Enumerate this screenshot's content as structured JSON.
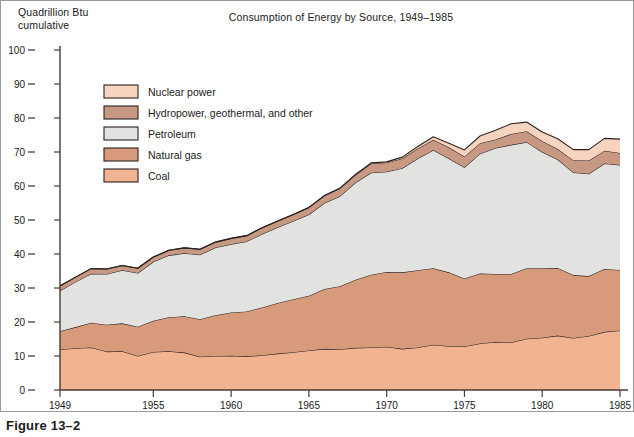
{
  "figure": {
    "caption": "Figure 13–2",
    "axis_unit_label": "Quadrillion Btu\ncumulative"
  },
  "chart_data": {
    "type": "area",
    "stacked": true,
    "title": "Consumption of Energy by Source, 1949–1985",
    "xlabel": "",
    "ylabel": "Quadrillion Btu cumulative",
    "ylim": [
      0,
      100
    ],
    "xlim": [
      1949,
      1985
    ],
    "grid": false,
    "legend_position": "upper-left-inside",
    "y_ticks": [
      0,
      10,
      20,
      30,
      40,
      50,
      60,
      70,
      80,
      90,
      100
    ],
    "x_ticks": [
      1949,
      1955,
      1960,
      1965,
      1970,
      1975,
      1980,
      1985
    ],
    "x": [
      1949,
      1950,
      1951,
      1952,
      1953,
      1954,
      1955,
      1956,
      1957,
      1958,
      1959,
      1960,
      1961,
      1962,
      1963,
      1964,
      1965,
      1966,
      1967,
      1968,
      1969,
      1970,
      1971,
      1972,
      1973,
      1974,
      1975,
      1976,
      1977,
      1978,
      1979,
      1980,
      1981,
      1982,
      1983,
      1984,
      1985
    ],
    "series": [
      {
        "name": "Coal",
        "color": "#f2b393",
        "values": [
          11.9,
          12.3,
          12.5,
          11.3,
          11.4,
          10.0,
          11.2,
          11.4,
          11.0,
          9.8,
          10.0,
          10.1,
          9.9,
          10.2,
          10.7,
          11.1,
          11.6,
          12.1,
          12.0,
          12.4,
          12.5,
          12.7,
          12.1,
          12.5,
          13.3,
          12.9,
          12.8,
          13.7,
          14.1,
          14.0,
          15.1,
          15.4,
          16.0,
          15.3,
          15.9,
          17.1,
          17.5
        ]
      },
      {
        "name": "Natural gas",
        "color": "#d79b7b",
        "values": [
          5.4,
          6.2,
          7.3,
          7.9,
          8.2,
          8.6,
          9.2,
          10.0,
          10.7,
          11.0,
          12.0,
          12.7,
          13.2,
          14.1,
          14.9,
          15.6,
          16.1,
          17.6,
          18.5,
          20.0,
          21.4,
          22.0,
          22.5,
          22.7,
          22.5,
          21.7,
          20.0,
          20.6,
          20.0,
          20.1,
          20.7,
          20.4,
          19.9,
          18.5,
          17.6,
          18.5,
          17.8
        ]
      },
      {
        "name": "Petroleum",
        "color": "#e2e3e1",
        "values": [
          11.9,
          13.3,
          14.4,
          14.9,
          15.6,
          15.8,
          17.3,
          18.2,
          18.5,
          19.0,
          19.9,
          20.1,
          20.6,
          21.6,
          22.3,
          23.0,
          23.9,
          25.3,
          26.5,
          28.6,
          30.0,
          29.5,
          30.6,
          32.9,
          34.8,
          33.5,
          32.7,
          35.2,
          37.1,
          38.0,
          37.1,
          34.2,
          31.9,
          30.2,
          30.1,
          31.0,
          30.9
        ]
      },
      {
        "name": "Hydropower, geothermal, and other",
        "color": "#c79982",
        "values": [
          1.4,
          1.4,
          1.5,
          1.5,
          1.4,
          1.4,
          1.4,
          1.5,
          1.6,
          1.6,
          1.6,
          1.7,
          1.7,
          1.8,
          1.8,
          1.9,
          2.1,
          2.1,
          2.3,
          2.3,
          2.7,
          2.7,
          2.9,
          2.9,
          3.0,
          3.3,
          3.2,
          3.1,
          2.5,
          3.2,
          3.2,
          3.2,
          3.1,
          3.6,
          3.9,
          3.8,
          3.5
        ]
      },
      {
        "name": "Nuclear power",
        "color": "#f7d4c0",
        "values": [
          0.0,
          0.0,
          0.0,
          0.0,
          0.0,
          0.0,
          0.0,
          0.0,
          0.0,
          0.0,
          0.0,
          0.0,
          0.0,
          0.0,
          0.0,
          0.0,
          0.0,
          0.1,
          0.1,
          0.1,
          0.2,
          0.2,
          0.4,
          0.6,
          0.9,
          1.2,
          1.9,
          2.1,
          2.7,
          3.0,
          2.7,
          2.7,
          3.0,
          3.1,
          3.2,
          3.6,
          4.1
        ]
      }
    ],
    "legend": [
      {
        "label": "Nuclear power",
        "color": "#f7d4c0"
      },
      {
        "label": "Hydropower, geothermal, and other",
        "color": "#c79982"
      },
      {
        "label": "Petroleum",
        "color": "#e2e3e1"
      },
      {
        "label": "Natural gas",
        "color": "#d79b7b"
      },
      {
        "label": "Coal",
        "color": "#f2b393"
      }
    ]
  },
  "style": {
    "axis_color": "#4a3a33",
    "line_color": "#2b2220",
    "frame_color": "#9a9a9a"
  }
}
